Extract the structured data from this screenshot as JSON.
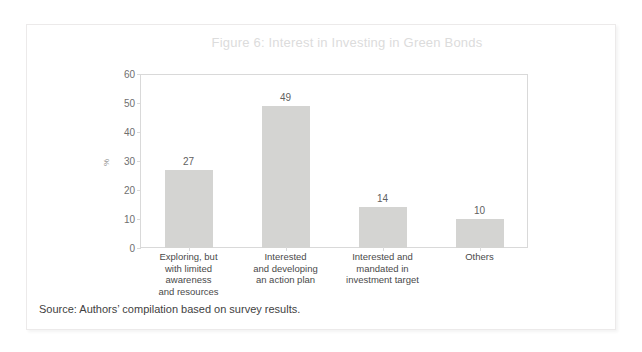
{
  "figure": {
    "title": "Figure 6: Interest in Investing in Green Bonds",
    "source": "Source: Authors’ compilation based on survey results."
  },
  "chart_data": {
    "type": "bar",
    "title": "Figure 6: Interest in Investing in Green Bonds",
    "categories": [
      "Exploring, but with limited awareness and resources",
      "Interested and developing an action plan",
      "Interested and mandated in investment target",
      "Others"
    ],
    "category_lines": [
      [
        "Exploring, but",
        "with limited",
        "awareness",
        "and resources"
      ],
      [
        "Interested",
        "and developing",
        "an action plan"
      ],
      [
        "Interested and",
        "mandated in",
        "investment target"
      ],
      [
        "Others"
      ]
    ],
    "values": [
      27,
      49,
      14,
      10
    ],
    "xlabel": "",
    "ylabel": "%",
    "ylim": [
      0,
      60
    ],
    "yticks": [
      0,
      10,
      20,
      30,
      40,
      50,
      60
    ],
    "grid": false,
    "legend": "none",
    "bar_color": "#d4d4d2",
    "data_labels": [
      "27",
      "49",
      "14",
      "10"
    ]
  }
}
